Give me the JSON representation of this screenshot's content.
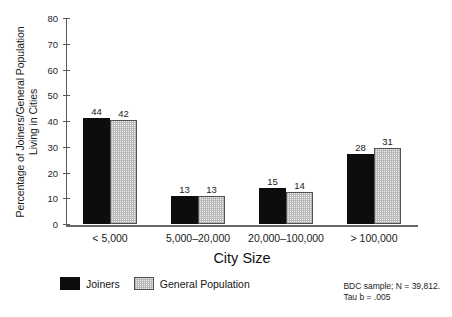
{
  "chart_data": {
    "type": "bar",
    "title": "",
    "xlabel": "City Size",
    "ylabel_line1": "Percentage of Joiners/General Population",
    "ylabel_line2": "Living in Cities",
    "categories": [
      "< 5,000",
      "5,000–20,000",
      "20,000–100,000",
      "> 100,000"
    ],
    "series": [
      {
        "name": "Joiners",
        "color": "#0d0d0d",
        "values": [
          44,
          13,
          15,
          28
        ],
        "plotted_heights": [
          41,
          11,
          14,
          27
        ],
        "labels": [
          "44",
          "13",
          "15",
          "28"
        ]
      },
      {
        "name": "General Population",
        "color": "#eeeeee",
        "values": [
          42,
          13,
          13,
          31
        ],
        "plotted_heights": [
          40.5,
          11,
          12.5,
          29.5
        ],
        "labels": [
          "42",
          "13",
          "14",
          "31"
        ]
      }
    ],
    "ylim": [
      0,
      80
    ],
    "yticks": [
      0,
      10,
      20,
      30,
      40,
      50,
      60,
      70,
      80
    ],
    "ytick_labels": [
      "0",
      "10",
      "20",
      "30",
      "40",
      "50",
      "60",
      "70",
      "80"
    ],
    "grid": false,
    "legend_position": "below-left",
    "annotations": [
      "BDC sample; N = 39,812.",
      "Tau b = .005"
    ]
  },
  "legend": {
    "entries": [
      {
        "label": "Joiners",
        "swatch": "solid-black-swatch"
      },
      {
        "label": "General Population",
        "swatch": "hatched-gray-swatch"
      }
    ]
  },
  "footnote": {
    "line1": "BDC sample; N = 39,812.",
    "line2": "Tau b = .005"
  }
}
